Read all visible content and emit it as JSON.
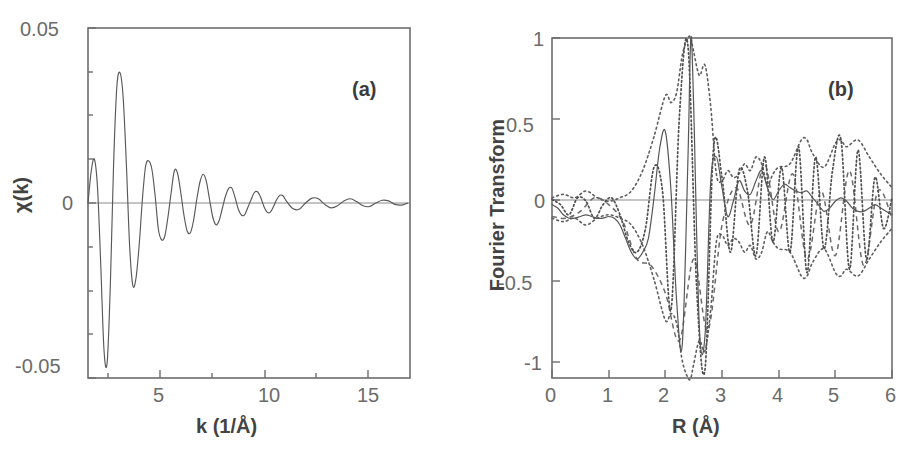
{
  "figure": {
    "type": "scientific-two-panel-plot",
    "background": "#ffffff",
    "ink_color": "#5a5a5a"
  },
  "panel_a": {
    "tag": "(a)",
    "ylabel": "χ(k)",
    "xlabel": "k (1/Å)",
    "ytick_labels": [
      "0.05",
      "0",
      "-0.05"
    ],
    "xtick_labels": [
      "5",
      "10",
      "15"
    ]
  },
  "panel_b": {
    "tag": "(b)",
    "ylabel": "Fourier Transform",
    "xlabel": "R (Å)",
    "ytick_labels": [
      "1",
      "0.5",
      "0",
      "-0.5",
      "-1"
    ],
    "xtick_labels": [
      "0",
      "1",
      "2",
      "3",
      "4",
      "5",
      "6"
    ]
  },
  "chart_data": [
    {
      "type": "line",
      "id": "panel-a",
      "title": "(a)",
      "xlabel": "k (1/Å)",
      "ylabel": "χ(k)",
      "xlim": [
        2.7,
        17.8
      ],
      "ylim": [
        -0.05,
        0.05
      ],
      "xticks": [
        5,
        10,
        15
      ],
      "yticks": [
        -0.05,
        0,
        0.05
      ],
      "grid": false,
      "legend": "none",
      "series": [
        {
          "name": "chi(k) EXAFS oscillation",
          "style": "solid-thin",
          "comment": "damped oscillation, strong at low k, decaying into noise beyond k=12",
          "x": [
            2.7,
            2.85,
            3.0,
            3.15,
            3.3,
            3.45,
            3.6,
            3.75,
            3.9,
            4.05,
            4.2,
            4.35,
            4.5,
            4.65,
            4.8,
            4.95,
            5.1,
            5.25,
            5.4,
            5.55,
            5.7,
            5.85,
            6.0,
            6.15,
            6.3,
            6.45,
            6.6,
            6.75,
            6.9,
            7.05,
            7.2,
            7.35,
            7.5,
            7.65,
            7.8,
            7.95,
            8.1,
            8.25,
            8.4,
            8.55,
            8.7,
            8.85,
            9.0,
            9.15,
            9.3,
            9.45,
            9.6,
            9.75,
            9.9,
            10.05,
            10.2,
            10.35,
            10.5,
            10.65,
            10.8,
            10.95,
            11.1,
            11.25,
            11.4,
            11.55,
            11.7,
            11.85,
            12.0,
            12.3,
            12.6,
            12.9,
            13.2,
            13.5,
            13.8,
            14.1,
            14.4,
            14.7,
            15.0,
            15.3,
            15.6,
            15.9,
            16.2,
            16.5,
            16.8,
            17.1,
            17.4,
            17.7
          ],
          "y": [
            0.0,
            0.009,
            0.0125,
            0.004,
            -0.018,
            -0.042,
            -0.0455,
            -0.023,
            0.011,
            0.033,
            0.0372,
            0.03,
            0.011,
            -0.012,
            -0.0235,
            -0.0215,
            -0.012,
            0.001,
            0.0105,
            0.012,
            0.0095,
            0.002,
            -0.0075,
            -0.0105,
            -0.0095,
            -0.004,
            0.003,
            0.0092,
            0.0085,
            0.003,
            -0.0035,
            -0.008,
            -0.0085,
            -0.005,
            0.001,
            0.006,
            0.0082,
            0.0062,
            0.001,
            -0.004,
            -0.0062,
            -0.005,
            -0.0015,
            0.002,
            0.0042,
            0.0042,
            0.0015,
            -0.0018,
            -0.0035,
            -0.0033,
            -0.0012,
            0.001,
            0.003,
            0.0032,
            0.0016,
            -0.001,
            -0.0026,
            -0.0026,
            -0.001,
            0.001,
            0.0022,
            0.002,
            0.0006,
            -0.0016,
            -0.0018,
            0.0,
            0.0014,
            0.0012,
            -0.0004,
            -0.0014,
            -0.0008,
            0.0006,
            0.0012,
            0.0004,
            -0.0008,
            -0.001,
            0.0,
            0.0008,
            0.0006,
            -0.0004,
            -0.0006,
            0.0
          ]
        }
      ]
    },
    {
      "type": "line",
      "id": "panel-b",
      "title": "(b)",
      "xlabel": "R (Å)",
      "ylabel": "Fourier Transform",
      "xlim": [
        0,
        6
      ],
      "ylim": [
        -1,
        1
      ],
      "xticks": [
        0,
        1,
        2,
        3,
        4,
        5,
        6
      ],
      "yticks": [
        -1,
        -0.5,
        0,
        0.5,
        1
      ],
      "grid": false,
      "legend": "none",
      "series": [
        {
          "name": "FT real part (solid)",
          "style": "solid-thin",
          "comment": "main peak near R=2.45 reaching +1.0, deep negative lobes near 2.2 and 2.8",
          "x": [
            0.0,
            0.1,
            0.2,
            0.3,
            0.4,
            0.5,
            0.6,
            0.7,
            0.8,
            0.9,
            1.0,
            1.1,
            1.2,
            1.3,
            1.4,
            1.5,
            1.6,
            1.7,
            1.8,
            1.9,
            2.0,
            2.1,
            2.2,
            2.3,
            2.4,
            2.45,
            2.5,
            2.6,
            2.7,
            2.8,
            2.9,
            3.0,
            3.1,
            3.2,
            3.3,
            3.4,
            3.5,
            3.6,
            3.7,
            3.8,
            3.9,
            4.0,
            4.1,
            4.2,
            4.3,
            4.4,
            4.5,
            4.6,
            4.7,
            4.8,
            4.9,
            5.0,
            5.1,
            5.2,
            5.3,
            5.4,
            5.5,
            5.6,
            5.7,
            5.8,
            5.9,
            6.0
          ],
          "y": [
            0.02,
            0.0,
            -0.04,
            -0.06,
            -0.06,
            -0.05,
            -0.04,
            -0.05,
            -0.06,
            -0.06,
            -0.05,
            -0.06,
            -0.1,
            -0.18,
            -0.26,
            -0.3,
            -0.26,
            -0.18,
            0.06,
            0.35,
            0.45,
            0.1,
            -0.55,
            -0.8,
            0.3,
            1.0,
            0.6,
            -0.7,
            -0.75,
            0.15,
            0.3,
            0.12,
            -0.05,
            0.04,
            0.16,
            0.1,
            0.08,
            0.16,
            0.22,
            0.12,
            0.05,
            0.1,
            0.14,
            0.12,
            0.1,
            0.09,
            0.1,
            0.06,
            0.02,
            -0.02,
            0.0,
            0.04,
            0.06,
            0.04,
            0.0,
            -0.02,
            -0.02,
            0.0,
            0.02,
            0.0,
            -0.02,
            -0.04
          ]
        },
        {
          "name": "FT envelope / magnitude (dotted outer)",
          "style": "dotted",
          "comment": "broad dotted envelope peaking ~1.0 at R=2.45 with side lobes near 4.5 and 5.2",
          "x": [
            0.0,
            0.2,
            0.4,
            0.6,
            0.8,
            1.0,
            1.2,
            1.4,
            1.6,
            1.8,
            2.0,
            2.1,
            2.2,
            2.3,
            2.4,
            2.45,
            2.5,
            2.6,
            2.7,
            2.8,
            2.9,
            3.0,
            3.1,
            3.2,
            3.3,
            3.4,
            3.5,
            3.6,
            3.7,
            3.8,
            3.9,
            4.0,
            4.2,
            4.4,
            4.5,
            4.6,
            4.8,
            5.0,
            5.1,
            5.2,
            5.4,
            5.6,
            5.8,
            6.0
          ],
          "y": [
            0.06,
            0.08,
            0.06,
            0.1,
            0.06,
            0.04,
            0.06,
            0.1,
            0.22,
            0.42,
            0.66,
            0.62,
            0.68,
            0.9,
            1.0,
            1.0,
            0.92,
            0.78,
            0.84,
            0.6,
            0.2,
            0.16,
            0.22,
            0.18,
            0.2,
            0.26,
            0.22,
            0.3,
            0.26,
            0.14,
            0.2,
            0.24,
            0.26,
            0.4,
            0.4,
            0.32,
            0.24,
            0.38,
            0.4,
            0.36,
            0.4,
            0.3,
            0.2,
            0.12
          ]
        },
        {
          "name": "FT imaginary part (dotted oscillatory)",
          "style": "dotted-dense",
          "comment": "rapidly oscillating dotted curve, amplitude ~1 at 2.5 A, ~0.4 at 4.5-5.5 A",
          "x": [
            0.0,
            0.15,
            0.3,
            0.45,
            0.6,
            0.75,
            0.9,
            1.05,
            1.2,
            1.35,
            1.5,
            1.65,
            1.8,
            1.95,
            2.1,
            2.25,
            2.4,
            2.55,
            2.7,
            2.85,
            3.0,
            3.15,
            3.3,
            3.45,
            3.6,
            3.75,
            3.9,
            4.05,
            4.2,
            4.35,
            4.5,
            4.65,
            4.8,
            4.95,
            5.1,
            5.25,
            5.4,
            5.55,
            5.7,
            5.85,
            6.0
          ],
          "y": [
            0.05,
            0.02,
            -0.04,
            0.06,
            0.04,
            -0.06,
            0.02,
            0.06,
            -0.04,
            -0.2,
            -0.26,
            -0.12,
            0.24,
            0.1,
            -0.6,
            0.55,
            0.95,
            -0.45,
            -0.95,
            0.35,
            0.18,
            -0.26,
            0.22,
            0.1,
            -0.28,
            0.3,
            -0.2,
            0.24,
            -0.26,
            0.36,
            -0.38,
            0.3,
            -0.24,
            0.22,
            0.4,
            -0.36,
            0.34,
            -0.3,
            0.18,
            -0.12,
            0.06
          ]
        },
        {
          "name": "FT second model (dashed)",
          "style": "dashed",
          "comment": "secondary fit curve, visible mainly between 3 and 6 Angstrom",
          "x": [
            0.0,
            0.25,
            0.5,
            0.75,
            1.0,
            1.25,
            1.5,
            1.75,
            2.0,
            2.25,
            2.5,
            2.75,
            3.0,
            3.25,
            3.5,
            3.75,
            4.0,
            4.25,
            4.5,
            4.75,
            5.0,
            5.25,
            5.5,
            5.75,
            6.0
          ],
          "y": [
            -0.05,
            -0.06,
            -0.02,
            0.06,
            0.02,
            -0.08,
            -0.3,
            -0.34,
            -0.5,
            -0.78,
            -0.3,
            -0.72,
            -0.1,
            0.12,
            -0.1,
            0.26,
            -0.14,
            0.2,
            -0.3,
            0.1,
            -0.28,
            0.22,
            -0.34,
            0.1,
            -0.06
          ]
        }
      ]
    }
  ]
}
